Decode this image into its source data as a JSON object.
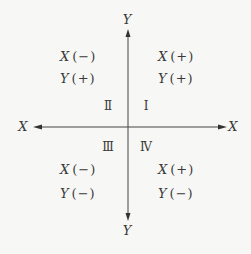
{
  "diagram": {
    "title": "",
    "axes": {
      "y_top_label": "Y",
      "y_bottom_label": "Y",
      "x_left_label": "X",
      "x_right_label": "X"
    },
    "quadrants": [
      {
        "id": "I",
        "numeral": "Ⅰ",
        "rows": [
          {
            "var": "X",
            "sign": "(+)"
          },
          {
            "var": "Y",
            "sign": "(+)"
          }
        ]
      },
      {
        "id": "II",
        "numeral": "Ⅱ",
        "rows": [
          {
            "var": "X",
            "sign": "(−)"
          },
          {
            "var": "Y",
            "sign": "(+)"
          }
        ]
      },
      {
        "id": "III",
        "numeral": "Ⅲ",
        "rows": [
          {
            "var": "X",
            "sign": "(−)"
          },
          {
            "var": "Y",
            "sign": "(−)"
          }
        ]
      },
      {
        "id": "IV",
        "numeral": "Ⅳ",
        "rows": [
          {
            "var": "X",
            "sign": "(+)"
          },
          {
            "var": "Y",
            "sign": "(−)"
          }
        ]
      }
    ],
    "colors": {
      "background": "#f7f7f5",
      "line": "#444444",
      "text": "#3a3a3a"
    }
  }
}
